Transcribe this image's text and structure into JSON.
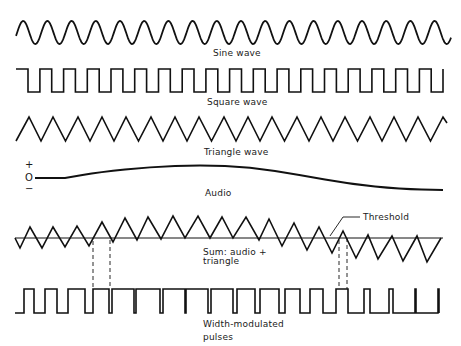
{
  "figure": {
    "ink_color": "#111111",
    "background": "#ffffff",
    "labels": {
      "sine": "Sine wave",
      "square": "Square wave",
      "triangle": "Triangle wave",
      "audio": "Audio",
      "sum_line1": "Sum: audio +",
      "sum_line2": "triangle",
      "threshold": "Threshold",
      "pwm_line1": "Width-modulated",
      "pwm_line2": "pulses"
    },
    "audio_axis": {
      "plus": "+",
      "zero": "O",
      "minus": "−"
    }
  },
  "waveforms": {
    "sine": {
      "x_start": 16,
      "x_end": 451,
      "period": 24.2,
      "y_center": 32.5,
      "amplitude": 11.5,
      "start_phase": -0.3
    },
    "square": {
      "x_start": 16,
      "x_end": 443,
      "first_edge": 28,
      "half_period": 11.86,
      "y_high": 69,
      "y_low": 92
    },
    "triangle": {
      "x_start": 16,
      "peaks": [
        29,
        53,
        78,
        102,
        126,
        151,
        175,
        199,
        224,
        248,
        272,
        297,
        321,
        345,
        370,
        394,
        418,
        443
      ],
      "x_end": 447,
      "y_peak": 117,
      "y_trough": 141
    },
    "audio": {
      "points": [
        [
          35,
          178
        ],
        [
          65,
          178
        ],
        [
          100,
          172
        ],
        [
          150,
          167
        ],
        [
          200,
          165
        ],
        [
          250,
          167
        ],
        [
          300,
          175
        ],
        [
          350,
          184
        ],
        [
          400,
          189
        ],
        [
          443,
          190
        ]
      ]
    },
    "sum": {
      "threshold": {
        "y": 238,
        "x_start": 15,
        "x_end": 443
      },
      "points": [
        [
          15,
          238
        ],
        [
          20,
          248
        ],
        [
          30,
          227
        ],
        [
          42,
          248
        ],
        [
          53,
          227
        ],
        [
          65,
          247
        ],
        [
          77,
          226
        ],
        [
          89,
          246
        ],
        [
          102,
          222
        ],
        [
          113,
          242
        ],
        [
          125,
          218
        ],
        [
          137,
          240
        ],
        [
          148,
          217
        ],
        [
          161,
          239
        ],
        [
          173,
          216
        ],
        [
          185,
          238
        ],
        [
          198,
          216
        ],
        [
          210,
          238
        ],
        [
          222,
          217
        ],
        [
          233,
          238
        ],
        [
          246,
          217
        ],
        [
          259,
          240
        ],
        [
          269,
          219
        ],
        [
          282,
          246
        ],
        [
          294,
          223
        ],
        [
          307,
          250
        ],
        [
          319,
          227
        ],
        [
          332,
          253
        ],
        [
          343,
          231
        ],
        [
          356,
          258
        ],
        [
          368,
          235
        ],
        [
          378,
          259
        ],
        [
          392,
          236
        ],
        [
          403,
          261
        ],
        [
          417,
          236
        ],
        [
          427,
          262
        ],
        [
          441,
          238
        ]
      ],
      "threshold_leader": [
        [
          360,
          217
        ],
        [
          343,
          217
        ],
        [
          330,
          236
        ]
      ]
    },
    "pwm": {
      "y_high": 289,
      "y_low": 313,
      "x_start": 15,
      "x_end": 440,
      "pulses": [
        [
          24,
          34
        ],
        [
          45,
          57
        ],
        [
          68,
          85
        ],
        [
          93,
          109
        ],
        [
          112,
          134
        ],
        [
          136,
          160
        ],
        [
          163,
          185
        ],
        [
          186,
          208
        ],
        [
          211,
          233
        ],
        [
          237,
          255
        ],
        [
          260,
          279
        ],
        [
          285,
          300
        ],
        [
          310,
          323
        ],
        [
          336,
          348
        ],
        [
          364,
          370
        ],
        [
          389,
          393
        ],
        [
          415,
          416
        ],
        [
          438,
          439
        ]
      ]
    },
    "dashed_markers": [
      {
        "x": 93,
        "y1": 241,
        "y2": 289
      },
      {
        "x": 110,
        "y1": 240,
        "y2": 289
      },
      {
        "x": 339,
        "y1": 240,
        "y2": 289
      },
      {
        "x": 347,
        "y1": 238,
        "y2": 289
      }
    ]
  }
}
